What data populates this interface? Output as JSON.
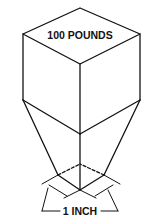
{
  "diagram": {
    "top_label": "100 POUNDS",
    "bottom_label": "1 INCH",
    "colors": {
      "line": "#111111",
      "background": "#ffffff"
    },
    "shapes": [
      "isometric-cube",
      "tapered-column",
      "small-base-cube",
      "dimension-arrows"
    ]
  }
}
